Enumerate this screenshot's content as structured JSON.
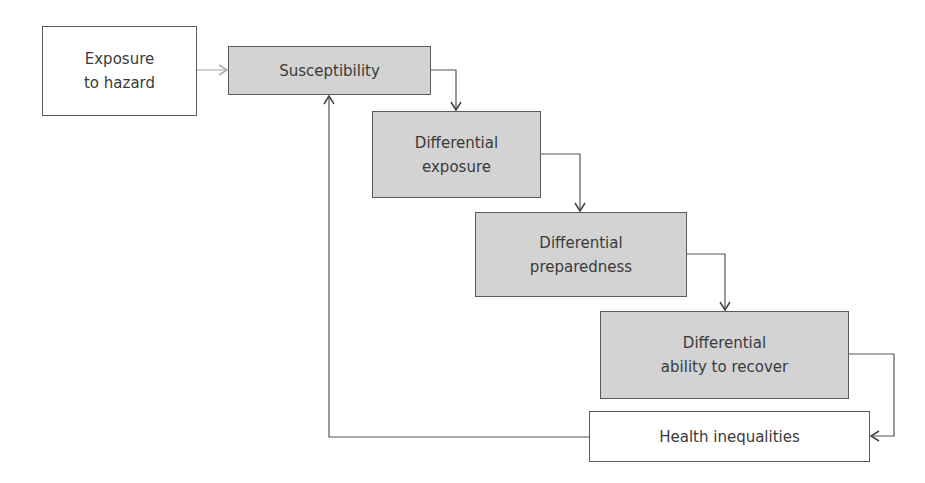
{
  "diagram": {
    "type": "flowchart",
    "nodes": [
      {
        "id": "exposure",
        "lines": [
          "Exposure",
          "to hazard"
        ],
        "style": "plain"
      },
      {
        "id": "susceptibility",
        "lines": [
          "Susceptibility"
        ],
        "style": "shaded"
      },
      {
        "id": "diff_exposure",
        "lines": [
          "Differential",
          "exposure"
        ],
        "style": "shaded"
      },
      {
        "id": "diff_preparedness",
        "lines": [
          "Differential",
          "preparedness"
        ],
        "style": "shaded"
      },
      {
        "id": "diff_recover",
        "lines": [
          "Differential",
          "ability to recover"
        ],
        "style": "shaded"
      },
      {
        "id": "health",
        "lines": [
          "Health inequalities"
        ],
        "style": "plain"
      }
    ],
    "edges": [
      {
        "from": "exposure",
        "to": "susceptibility",
        "style": "light"
      },
      {
        "from": "susceptibility",
        "to": "diff_exposure"
      },
      {
        "from": "diff_exposure",
        "to": "diff_preparedness"
      },
      {
        "from": "diff_preparedness",
        "to": "diff_recover"
      },
      {
        "from": "diff_recover",
        "to": "health"
      },
      {
        "from": "health",
        "to": "susceptibility",
        "label": "feedback"
      }
    ],
    "colors": {
      "shaded_fill": "#d3d3d3",
      "border": "#5a5a5a",
      "light_arrow": "#b0b0b0"
    }
  }
}
